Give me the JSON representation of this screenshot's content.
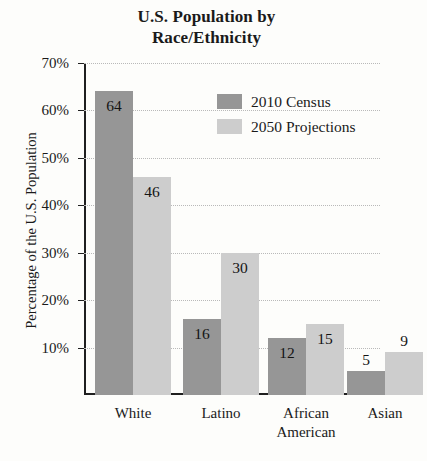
{
  "chart_data": {
    "type": "bar",
    "title": "U.S. Population by Race/Ethnicity",
    "title_lines": [
      "U.S. Population by",
      "Race/Ethnicity"
    ],
    "xlabel": "",
    "ylabel": "Percentage of the U.S. Population",
    "ylim": [
      0,
      70
    ],
    "ytick_values": [
      10,
      20,
      30,
      40,
      50,
      60,
      70
    ],
    "ytick_labels": [
      "10%",
      "20%",
      "30%",
      "40%",
      "50%",
      "60%",
      "70%"
    ],
    "grid": true,
    "legend_position": "upper-center-right",
    "categories": [
      "White",
      "Latino",
      "African American",
      "Asian"
    ],
    "category_lines": [
      [
        "White"
      ],
      [
        "Latino"
      ],
      [
        "African",
        "American"
      ],
      [
        "Asian"
      ]
    ],
    "series": [
      {
        "name": "2010 Census",
        "color": "#969696",
        "values": [
          64,
          16,
          12,
          5
        ]
      },
      {
        "name": "2050 Projections",
        "color": "#cdcdcd",
        "values": [
          46,
          30,
          15,
          9
        ]
      }
    ],
    "value_labels": {
      "series_0": [
        "64",
        "16",
        "12",
        "5"
      ],
      "series_1": [
        "46",
        "30",
        "15",
        "9"
      ]
    }
  },
  "legend": {
    "items": [
      {
        "label": "2010 Census",
        "color": "#969696"
      },
      {
        "label": "2050 Projections",
        "color": "#cdcdcd"
      }
    ]
  },
  "colors": {
    "background": "#fdfdfb",
    "axis": "#1f1f1f",
    "gridline": "#b9b9b9",
    "series_2010": "#969696",
    "series_2050": "#cdcdcd",
    "text": "#1a1a1a"
  }
}
